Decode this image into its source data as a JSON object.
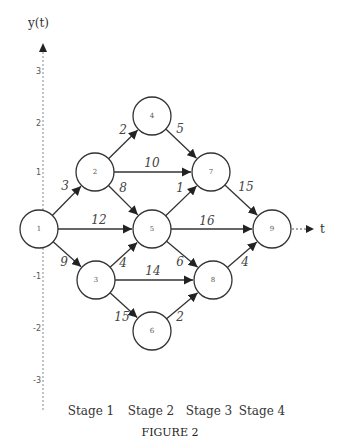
{
  "axes": {
    "y_label": "y(t)",
    "x_label": "t",
    "y_ticks": [
      {
        "label": "3",
        "y": 71
      },
      {
        "label": "2",
        "y": 123
      },
      {
        "label": "1",
        "y": 172
      },
      {
        "label": "-1",
        "y": 276
      },
      {
        "label": "-2",
        "y": 328
      },
      {
        "label": "-3",
        "y": 380
      }
    ]
  },
  "nodes": [
    {
      "id": "1",
      "label": "1",
      "x": 39,
      "y": 229
    },
    {
      "id": "2",
      "label": "2",
      "x": 95,
      "y": 172
    },
    {
      "id": "3",
      "label": "3",
      "x": 96,
      "y": 280
    },
    {
      "id": "4",
      "label": "4",
      "x": 152,
      "y": 116
    },
    {
      "id": "5",
      "label": "5",
      "x": 152,
      "y": 229
    },
    {
      "id": "6",
      "label": "6",
      "x": 152,
      "y": 331
    },
    {
      "id": "7",
      "label": "7",
      "x": 211,
      "y": 172
    },
    {
      "id": "8",
      "label": "8",
      "x": 213,
      "y": 280
    },
    {
      "id": "9",
      "label": "9",
      "x": 272,
      "y": 229
    }
  ],
  "edges": [
    {
      "from": "1",
      "to": "2",
      "weight": "3",
      "lx": 65,
      "ly": 190
    },
    {
      "from": "1",
      "to": "5",
      "weight": "12",
      "lx": 99,
      "ly": 224
    },
    {
      "from": "1",
      "to": "3",
      "weight": "9",
      "lx": 64,
      "ly": 266
    },
    {
      "from": "2",
      "to": "4",
      "weight": "2",
      "lx": 123,
      "ly": 134
    },
    {
      "from": "2",
      "to": "7",
      "weight": "10",
      "lx": 152,
      "ly": 167
    },
    {
      "from": "2",
      "to": "5",
      "weight": "8",
      "lx": 123,
      "ly": 192
    },
    {
      "from": "3",
      "to": "5",
      "weight": "4",
      "lx": 123,
      "ly": 267
    },
    {
      "from": "3",
      "to": "8",
      "weight": "14",
      "lx": 153,
      "ly": 275
    },
    {
      "from": "3",
      "to": "6",
      "weight": "15",
      "lx": 122,
      "ly": 321
    },
    {
      "from": "4",
      "to": "7",
      "weight": "5",
      "lx": 180,
      "ly": 133
    },
    {
      "from": "5",
      "to": "7",
      "weight": "1",
      "lx": 180,
      "ly": 192
    },
    {
      "from": "5",
      "to": "9",
      "weight": "16",
      "lx": 207,
      "ly": 225
    },
    {
      "from": "5",
      "to": "8",
      "weight": "6",
      "lx": 180,
      "ly": 266
    },
    {
      "from": "6",
      "to": "8",
      "weight": "2",
      "lx": 180,
      "ly": 321
    },
    {
      "from": "7",
      "to": "9",
      "weight": "15",
      "lx": 246,
      "ly": 191
    },
    {
      "from": "8",
      "to": "9",
      "weight": "4",
      "lx": 245,
      "ly": 266
    }
  ],
  "stages": [
    {
      "label": "Stage 1",
      "x": 91
    },
    {
      "label": "Stage 2",
      "x": 151
    },
    {
      "label": "Stage 3",
      "x": 209
    },
    {
      "label": "Stage 4",
      "x": 262
    }
  ],
  "caption": "FIGURE 2"
}
